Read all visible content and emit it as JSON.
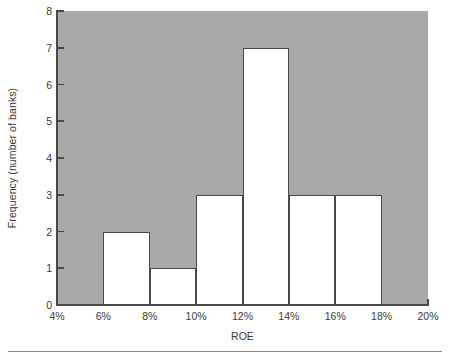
{
  "chart_data": {
    "type": "bar",
    "title": "",
    "subtitle": "",
    "xlabel": "ROE",
    "ylabel": "Frequency (number of banks)",
    "bin_edges": [
      4,
      6,
      8,
      10,
      12,
      14,
      16,
      18,
      20
    ],
    "categories": [
      "4%-6%",
      "6%-8%",
      "8%-10%",
      "10%-12%",
      "12%-14%",
      "14%-16%",
      "16%-18%",
      "18%-20%"
    ],
    "values": [
      0,
      2,
      1,
      3,
      7,
      3,
      3,
      0
    ],
    "bars": [
      {
        "label": "6%-8%",
        "x0": 6,
        "x1": 8,
        "value": 2
      },
      {
        "label": "8%-10%",
        "x0": 8,
        "x1": 10,
        "value": 1
      },
      {
        "label": "10%-12%",
        "x0": 10,
        "x1": 12,
        "value": 3
      },
      {
        "label": "12%-14%",
        "x0": 12,
        "x1": 14,
        "value": 7
      },
      {
        "label": "14%-16%",
        "x0": 14,
        "x1": 16,
        "value": 3
      },
      {
        "label": "16%-18%",
        "x0": 16,
        "x1": 18,
        "value": 3
      }
    ],
    "x_tick_labels": [
      "4%",
      "6%",
      "8%",
      "10%",
      "12%",
      "14%",
      "16%",
      "18%",
      "20%"
    ],
    "x_tick_values": [
      4,
      6,
      8,
      10,
      12,
      14,
      16,
      18,
      20
    ],
    "y_tick_labels": [
      "0",
      "1",
      "2",
      "3",
      "4",
      "5",
      "6",
      "7",
      "8"
    ],
    "y_tick_values": [
      0,
      1,
      2,
      3,
      4,
      5,
      6,
      7,
      8
    ],
    "xlim": [
      4,
      20
    ],
    "ylim": [
      0,
      8
    ],
    "grid": false,
    "legend": null,
    "colors": {
      "plot_background": "#a9a9a9",
      "bar_fill": "#ffffff",
      "bar_stroke": "#4a4a4a",
      "axis": "#4a4a4a",
      "text": "#3b3b3b",
      "figure_background": "#ffffff",
      "rule": "#8d8d8d"
    }
  }
}
